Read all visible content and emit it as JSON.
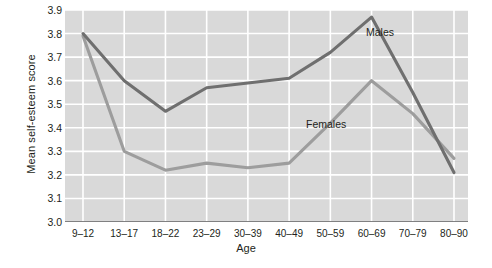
{
  "chart_data": {
    "type": "line",
    "title": "",
    "xlabel": "Age",
    "ylabel": "Mean self-esteem score",
    "categories": [
      "9–12",
      "13–17",
      "18–22",
      "23–29",
      "30–39",
      "40–49",
      "50–59",
      "60–69",
      "70–79",
      "80–90"
    ],
    "ylim": [
      3.0,
      3.9
    ],
    "yticks": [
      "3.0",
      "3.1",
      "3.2",
      "3.3",
      "3.4",
      "3.5",
      "3.6",
      "3.7",
      "3.8",
      "3.9"
    ],
    "grid": true,
    "legend_position": "inline-annotation",
    "series": [
      {
        "name": "Males",
        "color": "#6f6f6f",
        "values": [
          3.8,
          3.6,
          3.47,
          3.57,
          3.59,
          3.61,
          3.72,
          3.87,
          3.55,
          3.21
        ]
      },
      {
        "name": "Females",
        "color": "#9d9d9d",
        "values": [
          3.79,
          3.3,
          3.22,
          3.25,
          3.23,
          3.25,
          3.42,
          3.6,
          3.46,
          3.27
        ]
      }
    ],
    "annotations": [
      {
        "text": "Males",
        "series": "Males",
        "near_category": "60–69"
      },
      {
        "text": "Females",
        "series": "Females",
        "near_category": "50–59"
      }
    ],
    "colors": {
      "plot_background": "#d9d9d9",
      "gridline": "#ffffff",
      "axis": "#58585a",
      "males": "#6f6f6f",
      "females": "#9d9d9d"
    }
  }
}
